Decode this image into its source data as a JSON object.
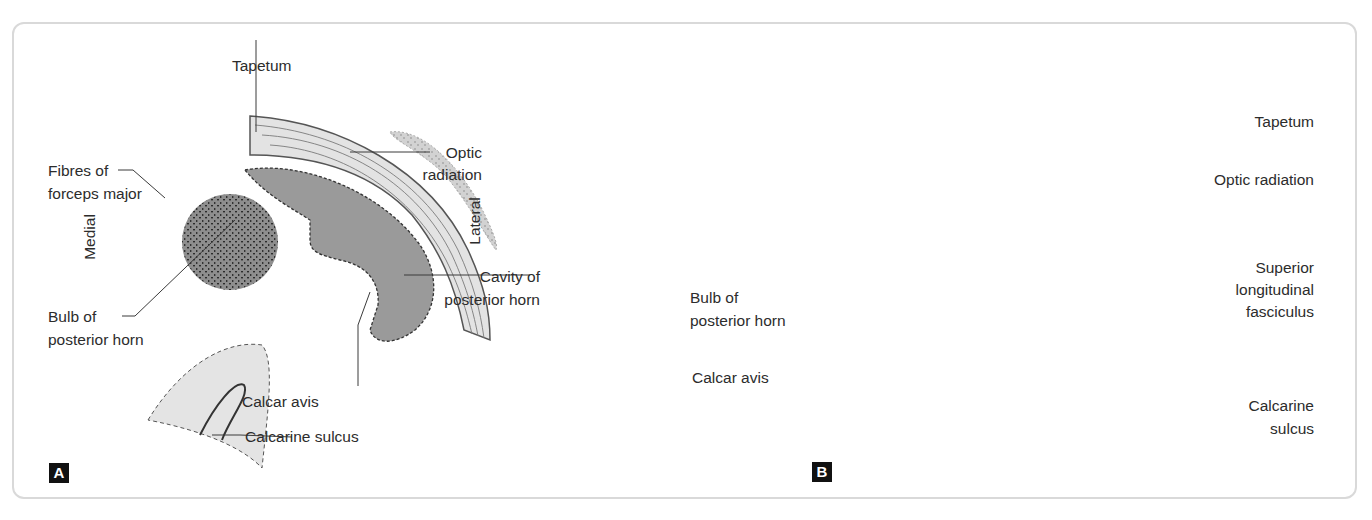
{
  "figure": {
    "panels": [
      {
        "id": "A",
        "type": "schematic drawing",
        "orientation": {
          "left": "Medial",
          "right": "Lateral"
        },
        "labels": {
          "tapetum": "Tapetum",
          "optic_radiation_1": "Optic",
          "optic_radiation_2": "radiation",
          "fibres_1": "Fibres of",
          "fibres_2": "forceps major",
          "cavity_1": "Cavity of",
          "cavity_2": "posterior horn",
          "bulb_1": "Bulb of",
          "bulb_2": "posterior horn",
          "calcar": "Calcar avis",
          "calcarine": "Calcarine sulcus"
        }
      },
      {
        "id": "B",
        "type": "photograph of brain section",
        "labels": {
          "tapetum": "Tapetum",
          "optic_radiation": "Optic radiation",
          "slf_1": "Superior",
          "slf_2": "longitudinal",
          "slf_3": "fasciculus",
          "bulb_1": "Bulb of",
          "bulb_2": "posterior horn",
          "calcar": "Calcar avis",
          "calcarine_1": "Calcarine",
          "calcarine_2": "sulcus"
        }
      }
    ]
  },
  "colors": {
    "border": "#d9d9d9",
    "cavity_fill": "#9a9a9a",
    "bulb_fill": "#8c8c8c",
    "light_fill": "#e4e4e4",
    "photo_bg": "#000000",
    "leader": "#3a3a3a"
  }
}
